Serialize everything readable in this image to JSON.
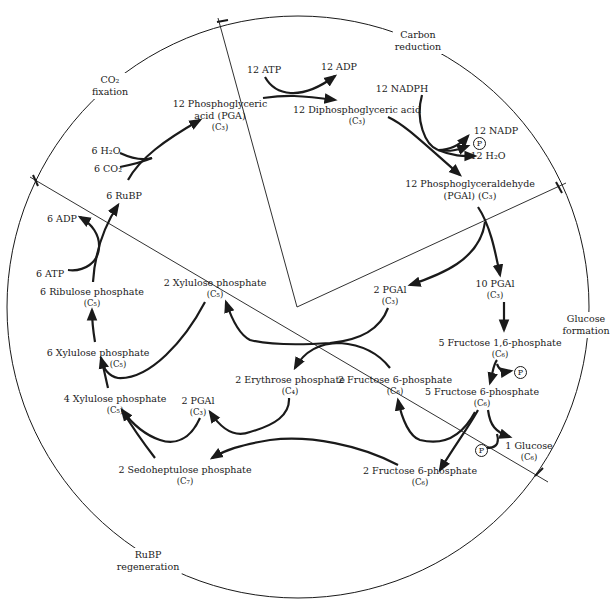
{
  "colors": {
    "ink": "#1a1a1a",
    "background": "#ffffff"
  },
  "phases": [
    {
      "id": "co2-fixation",
      "line1": "CO₂",
      "line2": "fixation",
      "x": 110,
      "y": 73
    },
    {
      "id": "carbon-reduction",
      "line1": "Carbon",
      "line2": "reduction",
      "x": 418,
      "y": 28
    },
    {
      "id": "glucose-formation",
      "line1": "Glucose",
      "line2": "formation",
      "x": 586,
      "y": 312
    },
    {
      "id": "rubp-regeneration",
      "line1": "RuBP",
      "line2": "regeneration",
      "x": 148,
      "y": 548
    }
  ],
  "compounds": [
    {
      "id": "pga",
      "line1": "12 Phosphoglyceric",
      "line2": "acid (PGA)",
      "sub": "(C₃)",
      "x": 220,
      "y": 98
    },
    {
      "id": "dpga",
      "line1": "12 Diphosphoglyceric acid",
      "sub": "(C₃)",
      "x": 357,
      "y": 104
    },
    {
      "id": "pgal12",
      "line1": "12 Phosphoglyceraldehyde",
      "line2": "(PGAl) (C₃)",
      "x": 470,
      "y": 178
    },
    {
      "id": "pgal10",
      "line1": "10 PGAl",
      "sub": "(C₃)",
      "x": 495,
      "y": 278
    },
    {
      "id": "pgal2-top",
      "line1": "2 PGAl",
      "sub": "(C₃)",
      "x": 390,
      "y": 284
    },
    {
      "id": "f16bp",
      "line1": "5 Fructose 1,6-phosphate",
      "sub": "(C₆)",
      "x": 500,
      "y": 337
    },
    {
      "id": "f6p5",
      "line1": "5 Fructose 6-phosphate",
      "sub": "(C₆)",
      "x": 482,
      "y": 386
    },
    {
      "id": "glucose",
      "line1": "1 Glucose",
      "sub": "(C₆)",
      "x": 529,
      "y": 440
    },
    {
      "id": "f6p2-mid",
      "line1": "2 Fructose 6-phosphate",
      "sub": "(C₆)",
      "x": 395,
      "y": 374
    },
    {
      "id": "f6p2-bottom",
      "line1": "2 Fructose 6-phosphate",
      "sub": "(C₆)",
      "x": 420,
      "y": 465
    },
    {
      "id": "erythrose",
      "line1": "2 Erythrose phosphate",
      "sub": "(C₄)",
      "x": 290,
      "y": 374
    },
    {
      "id": "pgal2-left",
      "line1": "2 PGAl",
      "sub": "(C₃)",
      "x": 198,
      "y": 395
    },
    {
      "id": "sedoheptulose",
      "line1": "2 Sedoheptulose phosphate",
      "sub": "(C₇)",
      "x": 185,
      "y": 464
    },
    {
      "id": "xylulose4",
      "line1": "4 Xylulose phosphate",
      "sub": "(C₅)",
      "x": 115,
      "y": 393
    },
    {
      "id": "xylulose6",
      "line1": "6 Xylulose phosphate",
      "sub": "(C₅)",
      "x": 98,
      "y": 347
    },
    {
      "id": "xylulose2",
      "line1": "2 Xylulose phosphate",
      "sub": "(C₅)",
      "x": 215,
      "y": 277
    },
    {
      "id": "ribulose",
      "line1": "6 Ribulose phosphate",
      "sub": "(C₅)",
      "x": 92,
      "y": 286
    },
    {
      "id": "rubp",
      "line1": "6 RuBP",
      "x": 124,
      "y": 190
    }
  ],
  "cofactors": [
    {
      "id": "atp12",
      "text": "12 ATP",
      "x": 264,
      "y": 64
    },
    {
      "id": "adp12",
      "text": "12 ADP",
      "x": 339,
      "y": 61
    },
    {
      "id": "nadph12",
      "text": "12 NADPH",
      "x": 402,
      "y": 83
    },
    {
      "id": "nadp12",
      "text": "12 NADP",
      "x": 496,
      "y": 125
    },
    {
      "id": "h2o12",
      "text": "12 H₂O",
      "x": 488,
      "y": 150
    },
    {
      "id": "h2o6",
      "text": "6 H₂O",
      "x": 106,
      "y": 145
    },
    {
      "id": "co26",
      "text": "6 CO₂",
      "x": 108,
      "y": 163
    },
    {
      "id": "adp6",
      "text": "6 ADP",
      "x": 62,
      "y": 213
    },
    {
      "id": "atp6",
      "text": "6 ATP",
      "x": 50,
      "y": 268
    }
  ],
  "phosphates": [
    {
      "id": "p-nadp",
      "symbol": "P",
      "x": 473,
      "y": 137
    },
    {
      "id": "p-f16",
      "symbol": "P",
      "x": 514,
      "y": 366
    },
    {
      "id": "p-glucose",
      "symbol": "P",
      "x": 475,
      "y": 444
    }
  ]
}
